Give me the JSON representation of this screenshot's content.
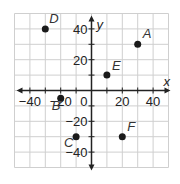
{
  "chart_data": {
    "type": "scatter",
    "title": "",
    "xlabel": "x",
    "ylabel": "y",
    "xlim": [
      -50,
      50
    ],
    "ylim": [
      -50,
      50
    ],
    "grid": true,
    "grid_step": 10,
    "x_ticks": [
      -40,
      -20,
      0,
      20,
      40
    ],
    "y_ticks": [
      40,
      20,
      -20,
      -40
    ],
    "tick_labels": {
      "x": [
        "−40",
        "−20",
        "20",
        "40"
      ],
      "y": [
        "40",
        "20",
        "−20",
        "−40"
      ],
      "origin": "0"
    },
    "points": [
      {
        "label": "A",
        "x": 30,
        "y": 30
      },
      {
        "label": "B",
        "x": -20,
        "y": -5
      },
      {
        "label": "C",
        "x": -10,
        "y": -30
      },
      {
        "label": "D",
        "x": -30,
        "y": 40
      },
      {
        "label": "E",
        "x": 10,
        "y": 10
      },
      {
        "label": "F",
        "x": 20,
        "y": -30
      }
    ]
  },
  "colors": {
    "grid": "#cfcfcf",
    "axis": "#222222",
    "point": "#1a1a1a"
  }
}
